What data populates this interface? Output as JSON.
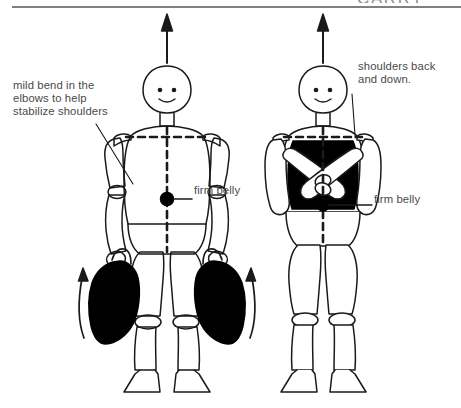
{
  "page": {
    "width": 461,
    "height": 408,
    "background": "#ffffff",
    "ink_color": "#1a1a1a",
    "text_color": "#4a4a4a",
    "fill_color": "#000000",
    "header_rule_color": "#555555"
  },
  "header": {
    "partial_text": "CARRY",
    "rule_visible": "true"
  },
  "annotations": {
    "elbows": "mild bend in the\nelbows to help\nstabilize shoulders",
    "shoulders": "shoulders back\nand down.",
    "belly_left": "firm belly",
    "belly_right": "firm belly"
  },
  "figures": [
    {
      "id": "figure-left",
      "name": "carrying-figure-with-bags",
      "posture": "standing upright holding a weighted bag in each hand",
      "up_arrow": "true",
      "dashed_shoulder_line": "true",
      "dashed_center_line": "true",
      "belly_dot": "true",
      "bags": 2,
      "lift_arrows": 2
    },
    {
      "id": "figure-right",
      "name": "carrying-figure-arms-crossed",
      "posture": "standing upright with arms crossed over a shaded chest",
      "up_arrow": "true",
      "dashed_shoulder_line": "true",
      "dashed_center_line": "true",
      "belly_dot": "true",
      "shaded_torso": "true",
      "bags": 0,
      "lift_arrows": 0
    }
  ]
}
